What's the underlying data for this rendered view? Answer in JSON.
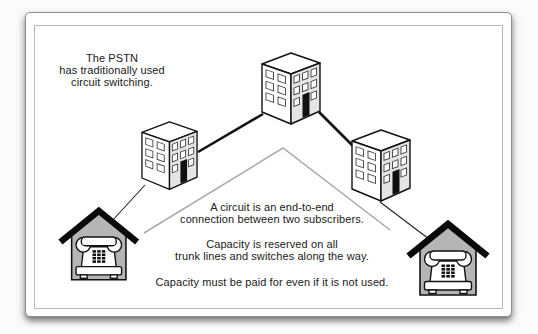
{
  "notes": {
    "pstn": {
      "lines": [
        "The PSTN",
        "has traditionally used",
        "circuit switching."
      ]
    },
    "circuit": {
      "lines": [
        "A circuit is an end-to-end",
        "connection between two subscribers."
      ]
    },
    "capacity": {
      "lines": [
        "Capacity is reserved on all",
        "trunk lines and switches along the way."
      ]
    },
    "payment": {
      "lines": [
        "Capacity must be paid for even if it is not used."
      ]
    }
  },
  "colors": {
    "card_background": "#ffffff",
    "card_border": "#8f8f8f",
    "inner_border": "#b6b6b6",
    "text": "#202020",
    "building_front": "#ffffff",
    "building_side": "#e4e4e4",
    "building_outline": "#111111",
    "door": "#101010",
    "house_fill": "#b5b5b5",
    "roof": "#0a0a0a",
    "phone_fill": "#ffffff",
    "trunk_line": "#111111",
    "subscriber_line": "#222222",
    "circuit_path": "#a9a9a9"
  }
}
